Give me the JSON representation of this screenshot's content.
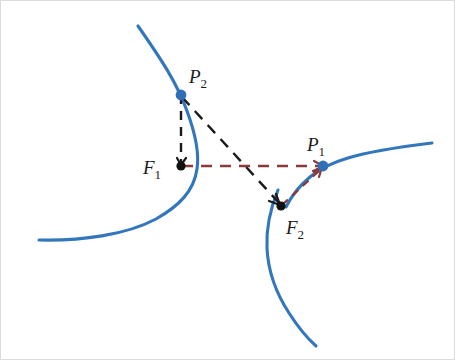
{
  "figure": {
    "background_color": "#ffffff",
    "width": 455,
    "height": 360
  },
  "colors": {
    "curve_blue": "#3276bd",
    "dash_black": "#1a1a1a",
    "dash_maroon": "#8b3a3a",
    "dot_black": "#111111",
    "dot_blue": "#2f6fb5",
    "label_text": "#1a1a1a",
    "border": "#dcdcdc"
  },
  "points": [
    {
      "id": "P2",
      "base": "P",
      "subscript": "2",
      "label": "P₂",
      "x": 180,
      "y": 94,
      "dot_color": "#2f6fb5",
      "label_x": 188,
      "label_y": 82
    },
    {
      "id": "F1",
      "base": "F",
      "subscript": "1",
      "label": "F₁",
      "x": 180,
      "y": 165,
      "dot_color": "#111111",
      "label_x": 142,
      "label_y": 173
    },
    {
      "id": "P1",
      "base": "P",
      "subscript": "1",
      "label": "P₁",
      "x": 322,
      "y": 165,
      "dot_color": "#2f6fb5",
      "label_x": 306,
      "label_y": 150
    },
    {
      "id": "F2",
      "base": "F",
      "subscript": "2",
      "label": "F₂",
      "x": 280,
      "y": 205,
      "dot_color": "#111111",
      "label_x": 285,
      "label_y": 233
    }
  ],
  "segments": [
    {
      "id": "P2-F1",
      "name": "segment-p2-f1",
      "from": "P2",
      "to": "F1",
      "style": "dashed",
      "color": "#1a1a1a",
      "x1": 180,
      "y1": 94,
      "x2": 180,
      "y2": 165
    },
    {
      "id": "P2-F2",
      "name": "segment-p2-f2",
      "from": "P2",
      "to": "F2",
      "style": "dashed",
      "color": "#1a1a1a",
      "x1": 181,
      "y1": 96,
      "x2": 279,
      "y2": 203
    },
    {
      "id": "F1-P1",
      "name": "segment-f1-p1",
      "from": "F1",
      "to": "P1",
      "style": "dashed",
      "color": "#8b3a3a",
      "x1": 181,
      "y1": 165,
      "x2": 321,
      "y2": 165
    },
    {
      "id": "F2-P1",
      "name": "segment-f2-p1",
      "from": "F2",
      "to": "P1",
      "style": "dashed",
      "color": "#8b3a3a",
      "x1": 281,
      "y1": 204,
      "x2": 321,
      "y2": 167
    }
  ],
  "curves": [
    {
      "id": "branch-upper-left",
      "name": "curve-branch-upper-left",
      "color": "#3276bd",
      "path": "M 137 25 C 160 58, 176 82, 186 110 C 196 137, 198 155, 196 168 C 193 190, 178 205, 155 218 C 125 234, 80 240, 38 239"
    },
    {
      "id": "branch-right",
      "name": "curve-branch-right",
      "color": "#3276bd",
      "path": "M 431 142 C 398 146, 370 150, 347 157 C 330 162, 318 168, 309 176 C 297 186, 290 196, 285 206"
    },
    {
      "id": "branch-lower",
      "name": "curve-branch-lower",
      "color": "#3276bd",
      "path": "M 277 189 C 270 206, 265 226, 266 247 C 267 270, 275 292, 288 312 C 297 326, 306 337, 315 345"
    }
  ],
  "arrow_hints": {
    "p1_incoming": "arrowhead on maroon dash into P1",
    "f2_incoming": "arrowhead on black dash into F2",
    "f1_incoming": "arrowhead on black dash into F1"
  }
}
